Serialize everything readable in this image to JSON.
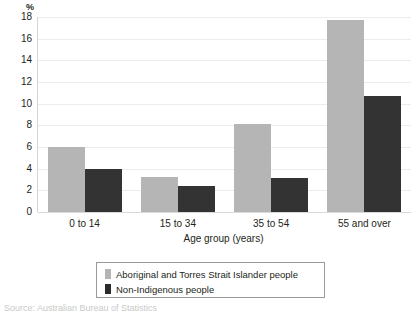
{
  "chart_data": {
    "type": "bar",
    "title": "",
    "unit_label": "%",
    "xlabel": "Age group (years)",
    "ylabel": "",
    "categories": [
      "0 to 14",
      "15 to 34",
      "35 to 54",
      "55 and over"
    ],
    "series": [
      {
        "name": "Aboriginal and Torres Strait Islander people",
        "color": "#b5b5b5",
        "values": [
          6.0,
          3.2,
          8.1,
          17.7
        ]
      },
      {
        "name": "Non-Indigenous people",
        "color": "#333333",
        "values": [
          4.0,
          2.4,
          3.1,
          10.7
        ]
      }
    ],
    "ylim": [
      0,
      18
    ],
    "ytick_values": [
      0,
      2,
      4,
      6,
      8,
      10,
      12,
      14,
      16,
      18
    ],
    "ytick_labels": [
      "0",
      "2",
      "4",
      "6",
      "8",
      "10",
      "12",
      "14",
      "16",
      "18"
    ],
    "grid": true,
    "legend_position": "bottom"
  },
  "legend": {
    "entries": [
      {
        "label": "Aboriginal and Torres Strait Islander people"
      },
      {
        "label": "Non-Indigenous people"
      }
    ]
  },
  "caption": {
    "text": "Source: Australian Bureau of Statistics"
  }
}
